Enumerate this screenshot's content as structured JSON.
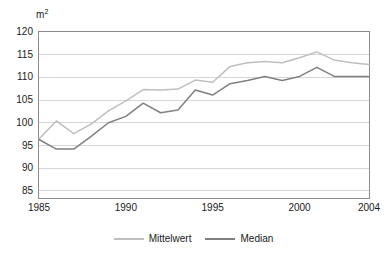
{
  "chart_data": {
    "type": "line",
    "title": "",
    "subtitle": "",
    "xlabel": "",
    "ylabel": "m²",
    "unit_label": "m²",
    "x": [
      1985,
      1986,
      1987,
      1988,
      1989,
      1990,
      1991,
      1992,
      1993,
      1994,
      1995,
      1996,
      1997,
      1998,
      1999,
      2000,
      2001,
      2002,
      2003,
      2004
    ],
    "xlim": [
      1985,
      2004
    ],
    "ylim": [
      83,
      120
    ],
    "yticks": [
      85,
      90,
      95,
      100,
      105,
      110,
      115,
      120
    ],
    "ytick_labels": [
      "85",
      "90",
      "95",
      "100",
      "105",
      "110",
      "115",
      "120"
    ],
    "xticks": [
      1985,
      1990,
      1995,
      2000,
      2004
    ],
    "xtick_labels": [
      "1985",
      "1990",
      "1995",
      "2000",
      "2004"
    ],
    "grid": true,
    "grid_axis": "y",
    "legend_position": "bottom",
    "series": [
      {
        "name": "Mittelwert",
        "color": "#bfbfbf",
        "values": [
          96.2,
          100.2,
          97.4,
          99.5,
          102.4,
          104.6,
          107.1,
          107.0,
          107.2,
          109.2,
          108.7,
          112.2,
          113.0,
          113.3,
          113.0,
          114.1,
          115.4,
          113.6,
          113.0,
          112.6
        ]
      },
      {
        "name": "Median",
        "color": "#808080",
        "values": [
          96.1,
          94.0,
          94.0,
          96.8,
          99.8,
          101.2,
          104.1,
          102.0,
          102.6,
          107.0,
          105.9,
          108.4,
          109.1,
          110.0,
          109.1,
          110.0,
          112.0,
          110.0,
          110.0,
          110.0
        ]
      }
    ]
  },
  "legend": {
    "items": [
      {
        "label": "Mittelwert",
        "color": "#bfbfbf"
      },
      {
        "label": "Median",
        "color": "#808080"
      }
    ]
  }
}
